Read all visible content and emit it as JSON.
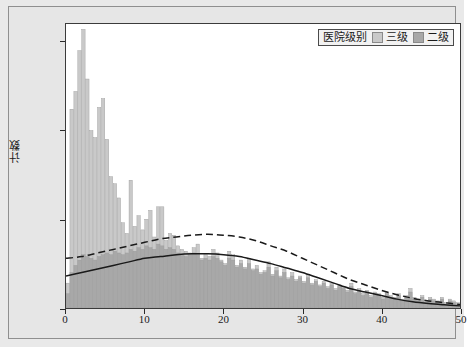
{
  "figure": {
    "background": "#e9e9e9",
    "plot_background": "#ffffff"
  },
  "legend": {
    "title": "医院级别",
    "entries": [
      {
        "label": "三级",
        "color": "#c9c9c9"
      },
      {
        "label": "二级",
        "color": "#a8a8a8"
      }
    ]
  },
  "chart_data": {
    "type": "bar",
    "title": "",
    "subtitle": "",
    "xlabel": "",
    "ylabel": "计数",
    "xlim": [
      0,
      50
    ],
    "ylim": [
      0,
      160
    ],
    "xticks": [
      0,
      10,
      20,
      30,
      40,
      50
    ],
    "yticks": [
      0,
      50,
      100,
      150
    ],
    "grid": false,
    "legend_position": "top-right",
    "bin_width": 0.5,
    "overlay_mode": "overlapping-histogram-with-density-curves",
    "x": [
      0.25,
      0.75,
      1.25,
      1.75,
      2.25,
      2.75,
      3.25,
      3.75,
      4.25,
      4.75,
      5.25,
      5.75,
      6.25,
      6.75,
      7.25,
      7.75,
      8.25,
      8.75,
      9.25,
      9.75,
      10.25,
      10.75,
      11.25,
      11.75,
      12.25,
      12.75,
      13.25,
      13.75,
      14.25,
      14.75,
      15.25,
      15.75,
      16.25,
      16.75,
      17.25,
      17.75,
      18.25,
      18.75,
      19.25,
      19.75,
      20.25,
      20.75,
      21.25,
      21.75,
      22.25,
      22.75,
      23.25,
      23.75,
      24.25,
      24.75,
      25.25,
      25.75,
      26.25,
      26.75,
      27.25,
      27.75,
      28.25,
      28.75,
      29.25,
      29.75,
      30.25,
      30.75,
      31.25,
      31.75,
      32.25,
      32.75,
      33.25,
      33.75,
      34.25,
      34.75,
      35.25,
      35.75,
      36.25,
      36.75,
      37.25,
      37.75,
      38.25,
      38.75,
      39.25,
      39.75,
      40.25,
      40.75,
      41.25,
      41.75,
      42.25,
      42.75,
      43.25,
      43.75,
      44.25,
      44.75,
      45.25,
      45.75,
      46.25,
      46.75,
      47.25,
      47.75,
      48.25,
      48.75,
      49.25,
      49.75
    ],
    "series": [
      {
        "name": "三级",
        "color": "#c9c9c9",
        "values": [
          14,
          112,
          122,
          145,
          157,
          129,
          100,
          96,
          113,
          118,
          95,
          74,
          70,
          62,
          48,
          42,
          72,
          46,
          52,
          44,
          50,
          55,
          40,
          57,
          57,
          38,
          42,
          41,
          35,
          33,
          32,
          31,
          34,
          36,
          28,
          30,
          29,
          33,
          31,
          27,
          25,
          32,
          30,
          24,
          27,
          23,
          28,
          22,
          24,
          20,
          21,
          26,
          19,
          23,
          18,
          22,
          17,
          20,
          16,
          18,
          15,
          19,
          14,
          16,
          13,
          15,
          12,
          14,
          11,
          13,
          12,
          10,
          14,
          9,
          11,
          8,
          10,
          7,
          9,
          8,
          6,
          9,
          7,
          6,
          8,
          5,
          7,
          11,
          6,
          5,
          7,
          4,
          6,
          5,
          4,
          6,
          3,
          5,
          4,
          3
        ]
      },
      {
        "name": "二级",
        "color": "#a8a8a8",
        "values": [
          8,
          20,
          24,
          27,
          30,
          29,
          28,
          27,
          29,
          30,
          31,
          30,
          32,
          31,
          30,
          31,
          33,
          32,
          34,
          33,
          35,
          34,
          33,
          36,
          35,
          33,
          34,
          33,
          31,
          30,
          29,
          30,
          31,
          30,
          27,
          28,
          27,
          29,
          28,
          26,
          24,
          28,
          27,
          23,
          25,
          22,
          25,
          21,
          22,
          19,
          20,
          23,
          18,
          21,
          17,
          20,
          16,
          18,
          15,
          17,
          14,
          17,
          13,
          15,
          12,
          14,
          11,
          13,
          10,
          12,
          11,
          9,
          12,
          8,
          10,
          7,
          9,
          6,
          8,
          7,
          5,
          8,
          6,
          5,
          7,
          4,
          6,
          9,
          5,
          4,
          6,
          3,
          5,
          4,
          3,
          5,
          2,
          4,
          3,
          2
        ]
      }
    ],
    "curves": [
      {
        "name": "二级-density",
        "style": "dashed",
        "color": "#1a1a1a",
        "points": [
          [
            0,
            28
          ],
          [
            2,
            29
          ],
          [
            4,
            31
          ],
          [
            6,
            33
          ],
          [
            8,
            35
          ],
          [
            10,
            37
          ],
          [
            12,
            39
          ],
          [
            14,
            40
          ],
          [
            16,
            41
          ],
          [
            18,
            41.5
          ],
          [
            20,
            41
          ],
          [
            22,
            40
          ],
          [
            24,
            38
          ],
          [
            26,
            35
          ],
          [
            28,
            32
          ],
          [
            30,
            28
          ],
          [
            32,
            24
          ],
          [
            34,
            20
          ],
          [
            36,
            16
          ],
          [
            38,
            13
          ],
          [
            40,
            10
          ],
          [
            42,
            7.5
          ],
          [
            44,
            5.5
          ],
          [
            46,
            4
          ],
          [
            48,
            3
          ],
          [
            50,
            2
          ]
        ]
      },
      {
        "name": "三级-density",
        "style": "solid",
        "color": "#1a1a1a",
        "points": [
          [
            0,
            18
          ],
          [
            2,
            20
          ],
          [
            4,
            22
          ],
          [
            6,
            24
          ],
          [
            8,
            26
          ],
          [
            10,
            28
          ],
          [
            12,
            29
          ],
          [
            14,
            30
          ],
          [
            16,
            30.5
          ],
          [
            18,
            30.5
          ],
          [
            20,
            30
          ],
          [
            22,
            29
          ],
          [
            24,
            27
          ],
          [
            26,
            25
          ],
          [
            28,
            22.5
          ],
          [
            30,
            20
          ],
          [
            32,
            17
          ],
          [
            34,
            14
          ],
          [
            36,
            11
          ],
          [
            38,
            9
          ],
          [
            40,
            7
          ],
          [
            42,
            5
          ],
          [
            44,
            3.5
          ],
          [
            46,
            2.5
          ],
          [
            48,
            1.8
          ],
          [
            50,
            1.2
          ]
        ]
      }
    ]
  }
}
